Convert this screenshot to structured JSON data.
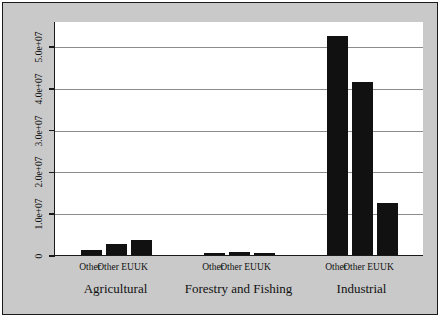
{
  "chart_data": {
    "type": "bar",
    "title": "",
    "subtitle": "",
    "xlabel": "",
    "ylabel": "Thousands of euros",
    "ylim": [
      0,
      56000000
    ],
    "grid": true,
    "grid_axis": "y",
    "legend": "none",
    "bar_color": "#111111",
    "plot_background": "#ffffff",
    "figure_background": "#c9c9c9",
    "gridline_color": "#8c8c8c",
    "axis_color": "#1a1a1a",
    "ytick_labels": [
      "0",
      "1.0e+07",
      "2.0e+07",
      "3.0e+07",
      "4.0e+07",
      "5.0e+07"
    ],
    "ytick_values": [
      0,
      10000000,
      20000000,
      30000000,
      40000000,
      50000000
    ],
    "groups": [
      {
        "name": "Agricultural",
        "categories": [
          "Other",
          "Other EU",
          "UK"
        ],
        "values": [
          1300000,
          2600000,
          3700000
        ]
      },
      {
        "name": "Forestry and Fishing",
        "categories": [
          "Other",
          "Other EU",
          "UK"
        ],
        "values": [
          500000,
          800000,
          400000
        ]
      },
      {
        "name": "Industrial",
        "categories": [
          "Other",
          "Other EU",
          "UK"
        ],
        "values": [
          52500000,
          41500000,
          12500000
        ]
      }
    ]
  }
}
